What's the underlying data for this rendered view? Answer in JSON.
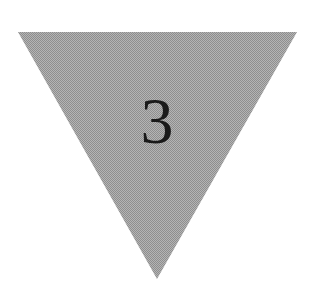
{
  "diagram": {
    "shape": "inverted-triangle",
    "label": "3",
    "colors": {
      "fill": "#a9a9a9",
      "fill_dither_light": "#c8c8c8",
      "fill_dither_dark": "#8c8c8c",
      "text": "#1a1a1a",
      "background": "#ffffff"
    }
  }
}
